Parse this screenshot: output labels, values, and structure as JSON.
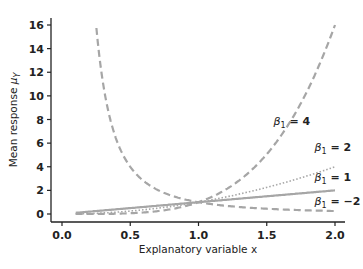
{
  "chart_data": {
    "type": "line",
    "title": "",
    "xlabel": "Explanatory variable x",
    "ylabel": "Mean response μ_Y",
    "xlim": [
      0.0,
      2.0
    ],
    "ylim": [
      0,
      16
    ],
    "xticks": [
      "0.0",
      "0.5",
      "1.0",
      "1.5",
      "2.0"
    ],
    "yticks": [
      "0",
      "2",
      "4",
      "6",
      "8",
      "10",
      "12",
      "14",
      "16"
    ],
    "grid": false,
    "legend": "inline annotations",
    "function": "mu = x^beta1",
    "x_range": [
      0.1,
      2.0
    ],
    "series": [
      {
        "name": "β1 = 4",
        "beta": 4,
        "style": "dashed",
        "label_pos": [
          1.55,
          7.5
        ],
        "x": [
          0.1,
          0.5,
          1.0,
          1.5,
          2.0
        ],
        "values": [
          0.0001,
          0.0625,
          1,
          5.06,
          16
        ]
      },
      {
        "name": "β1 = 2",
        "beta": 2,
        "style": "dotted",
        "label_pos": [
          1.85,
          5.3
        ],
        "x": [
          0.1,
          0.5,
          1.0,
          1.5,
          2.0
        ],
        "values": [
          0.01,
          0.25,
          1,
          2.25,
          4
        ]
      },
      {
        "name": "β1 = 1",
        "beta": 1,
        "style": "solid",
        "label_pos": [
          1.85,
          2.8
        ],
        "x": [
          0.1,
          0.5,
          1.0,
          1.5,
          2.0
        ],
        "values": [
          0.1,
          0.5,
          1,
          1.5,
          2
        ]
      },
      {
        "name": "β1 = −2",
        "beta": -2,
        "style": "dashed",
        "label_pos": [
          1.85,
          0.8
        ],
        "x": [
          0.1,
          0.5,
          1.0,
          1.5,
          2.0
        ],
        "values": [
          100,
          4,
          1,
          0.444,
          0.25
        ]
      }
    ]
  },
  "labels": {
    "xlabel": "Explanatory variable x",
    "ylabel_prefix": "Mean response ",
    "ylabel_symbol": "μ",
    "ylabel_sub": "Y",
    "beta_symbol": "β",
    "beta_sub": "1"
  },
  "colors": {
    "axis": "#222222",
    "curve": "#a6a6a6"
  }
}
